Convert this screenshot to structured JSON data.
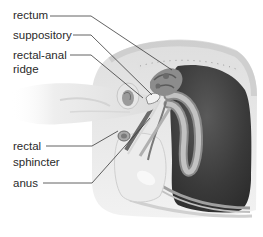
{
  "diagram": {
    "type": "anatomical-illustration",
    "labels": [
      {
        "id": "rectum",
        "lines": [
          "rectum"
        ]
      },
      {
        "id": "suppository",
        "lines": [
          "suppository"
        ]
      },
      {
        "id": "rectal-anal-ridge",
        "lines": [
          "rectal-anal",
          "ridge"
        ]
      },
      {
        "id": "rectal-sphincter",
        "lines": [
          "rectal",
          "sphincter"
        ]
      },
      {
        "id": "anus",
        "lines": [
          "anus"
        ]
      }
    ]
  },
  "colors": {
    "background": "#ffffff",
    "text": "#2a2a2a",
    "leader_line": "#3a3a3a",
    "organ_dark": "#3b3b3b",
    "tissue_light": "#e4e4e4",
    "tissue_mid": "#b5b5b5",
    "hand": "#ececec"
  }
}
